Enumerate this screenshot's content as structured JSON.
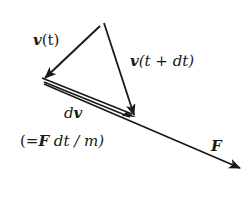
{
  "diagram": {
    "colors": {
      "stroke": "#1a1a1a",
      "background": "#ffffff"
    },
    "vectors": [
      {
        "id": "v_t",
        "from": [
          100,
          26
        ],
        "to": [
          43,
          79
        ],
        "label": "v(t)"
      },
      {
        "id": "v_t_dt",
        "from": [
          104,
          23
        ],
        "to": [
          135,
          116
        ],
        "label": "v(t + dt)"
      },
      {
        "id": "dv",
        "from": [
          43,
          79
        ],
        "to": [
          133,
          116
        ],
        "label": "dv",
        "style": "double"
      },
      {
        "id": "F",
        "from": [
          43,
          82
        ],
        "to": [
          242,
          169
        ],
        "label": "F"
      }
    ],
    "labels": {
      "v_t": {
        "bold": "v",
        "rest": "(t)"
      },
      "v_t_dt": {
        "bold": "v",
        "rest": "(t + dt)"
      },
      "dv": {
        "italic": "d",
        "bold": "v"
      },
      "dv_eq": {
        "open": "(=",
        "bold": "F",
        "rest": " dt / m)"
      },
      "F": {
        "bold": "F"
      }
    }
  }
}
